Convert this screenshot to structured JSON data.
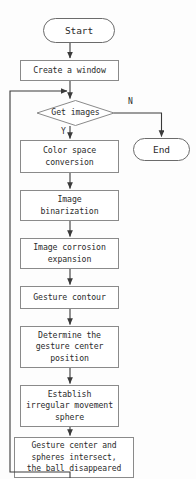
{
  "diagram": {
    "type": "flowchart",
    "colors": {
      "background": "#fdfdfd",
      "stroke": "#6b6b6b",
      "text": "#2b2b2b",
      "arrow": "#3a3a3a"
    },
    "nodes": [
      {
        "id": "start",
        "shape": "terminator",
        "label": "Start",
        "x": 43,
        "y": 18,
        "w": 72,
        "h": 25
      },
      {
        "id": "create-window",
        "shape": "process",
        "label": "Create a window",
        "x": 20,
        "y": 60,
        "w": 99,
        "h": 21
      },
      {
        "id": "get-images",
        "shape": "decision",
        "label": "Get images",
        "x": 37,
        "y": 100,
        "w": 77,
        "h": 26
      },
      {
        "id": "end",
        "shape": "terminator",
        "label": "End",
        "x": 133,
        "y": 138,
        "w": 57,
        "h": 23
      },
      {
        "id": "color-space-conversion",
        "shape": "process",
        "label": "Color space\nconversion",
        "x": 20,
        "y": 140,
        "w": 99,
        "h": 33
      },
      {
        "id": "image-binarization",
        "shape": "process",
        "label": "Image\nbinarization",
        "x": 20,
        "y": 190,
        "w": 99,
        "h": 31
      },
      {
        "id": "image-corrosion-expansion",
        "shape": "process",
        "label": "Image corrosion\nexpansion",
        "x": 20,
        "y": 238,
        "w": 99,
        "h": 31
      },
      {
        "id": "gesture-contour",
        "shape": "process",
        "label": "Gesture contour",
        "x": 20,
        "y": 286,
        "w": 99,
        "h": 23
      },
      {
        "id": "determine-gesture-center",
        "shape": "process",
        "label": "Determine the\ngesture center\nposition",
        "x": 20,
        "y": 326,
        "w": 99,
        "h": 42
      },
      {
        "id": "establish-sphere",
        "shape": "process",
        "label": "Establish\nirregular movement\nsphere",
        "x": 20,
        "y": 385,
        "w": 99,
        "h": 42
      },
      {
        "id": "ball-disappeared",
        "shape": "process",
        "label": "Gesture center and\nspheres intersect,\nthe ball disappeared",
        "x": 14,
        "y": 437,
        "w": 120,
        "h": 41
      }
    ],
    "edge_labels": [
      {
        "id": "yes",
        "text": "Y",
        "x": 61,
        "y": 128
      },
      {
        "id": "no",
        "text": "N",
        "x": 128,
        "y": 98
      }
    ]
  }
}
